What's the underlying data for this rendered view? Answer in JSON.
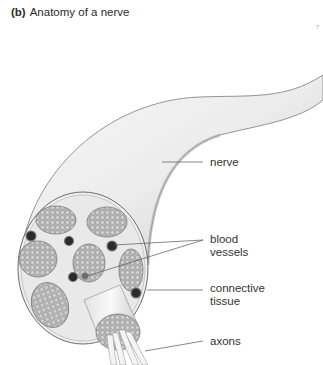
{
  "figure": {
    "tag": "(b)",
    "title": "Anatomy of a nerve",
    "page_mark": "7"
  },
  "labels": {
    "nerve": "nerve",
    "blood_vessels": [
      "blood",
      "vessels"
    ],
    "connective_tissue": [
      "connective",
      "tissue"
    ],
    "axons": "axons"
  },
  "colors": {
    "nerve_fill": "#efefef",
    "outline": "#6a6a6a",
    "fascicle": "#a9a9a9",
    "vessel": "#2b2b2b",
    "leader": "#555555"
  }
}
